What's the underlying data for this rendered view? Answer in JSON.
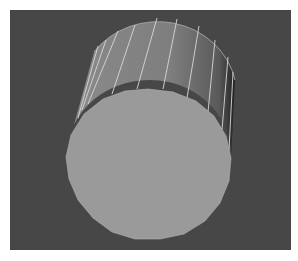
{
  "viewport": {
    "label": "3D viewport",
    "background": "#474747"
  },
  "object": {
    "type": "cylinder",
    "segments": 20,
    "cap_color": "#9a9a9a",
    "side_color": "#7e7e7e",
    "side_shadow_color": "#2a2a2a",
    "wire_color": "#d8d8d8"
  }
}
